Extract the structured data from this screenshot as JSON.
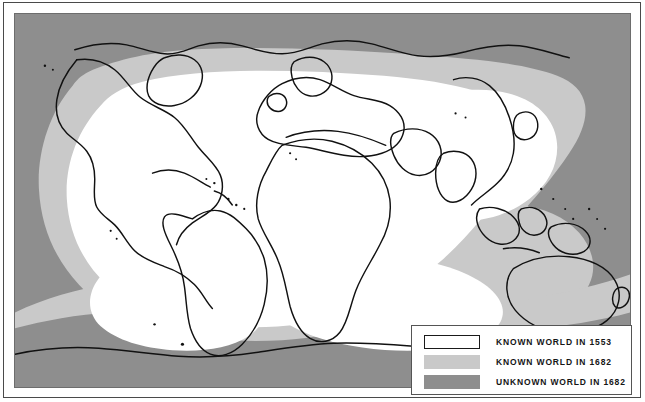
{
  "figure": {
    "kind": "historical-world-map"
  },
  "colors": {
    "known_1553": "#ffffff",
    "known_1682": "#c9c9c9",
    "unknown_1682": "#8e8e8e",
    "coastline": "#111111",
    "frame": "#4a4a4a",
    "legend_border": "#555555"
  },
  "legend": {
    "items": [
      {
        "swatch": "known-1553-swatch",
        "label": "KNOWN WORLD IN 1553",
        "fill": "#ffffff"
      },
      {
        "swatch": "known-1682-swatch",
        "label": "KNOWN WORLD IN 1682",
        "fill": "#c9c9c9"
      },
      {
        "swatch": "unknown-1682-swatch",
        "label": "UNKNOWN WORLD IN 1682",
        "fill": "#8e8e8e"
      }
    ]
  },
  "regions": {
    "unknown_areas": [
      "Arctic Ocean and northern polar sea",
      "Interior of northern Canada",
      "Interior of South America (Amazon basin)",
      "Interior of Africa",
      "Siberia and north-east Asia",
      "North and central Pacific Ocean",
      "Southern Ocean and Antarctic waters"
    ],
    "known_1682_areas": [
      "Northern and eastern Canada margins",
      "Coastal South America",
      "North and south African margins",
      "Australia and New Guinea",
      "Western Pacific approaches",
      "Southern Atlantic and Indian Ocean margins"
    ],
    "known_1553_areas": [
      "Europe and the Mediterranean",
      "North Atlantic Ocean",
      "Eastern North America and Caribbean",
      "West and east African coasts",
      "Indian Ocean",
      "South and east Asia",
      "Indonesian archipelago"
    ]
  }
}
